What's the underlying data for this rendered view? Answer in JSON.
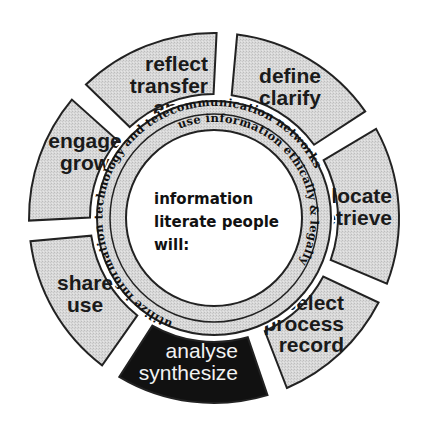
{
  "diagram": {
    "type": "circular-wheel",
    "center": {
      "lines": [
        "information",
        "literate people",
        "will:"
      ]
    },
    "segments": [
      {
        "id": "define",
        "lines": [
          "define",
          "clarify"
        ],
        "highlighted": false
      },
      {
        "id": "locate",
        "lines": [
          "locate",
          "retrieve"
        ],
        "highlighted": false
      },
      {
        "id": "select",
        "lines": [
          "select",
          "process",
          "record"
        ],
        "highlighted": false
      },
      {
        "id": "analyse",
        "lines": [
          "analyse",
          "synthesize"
        ],
        "highlighted": true
      },
      {
        "id": "share",
        "lines": [
          "share",
          "use"
        ],
        "highlighted": false
      },
      {
        "id": "engage",
        "lines": [
          "engage",
          "grow"
        ],
        "highlighted": false
      },
      {
        "id": "reflect",
        "lines": [
          "reflect",
          "transfer",
          "apply"
        ],
        "highlighted": false
      }
    ],
    "inner_ring": {
      "outer_band": "utilize information technology and telecommunication networks",
      "inner_band": "use information ethically & legally"
    },
    "colors": {
      "segment_fill": "#d6d6d6",
      "highlight_fill": "#111111",
      "outline": "#222222",
      "background": "#ffffff"
    }
  }
}
